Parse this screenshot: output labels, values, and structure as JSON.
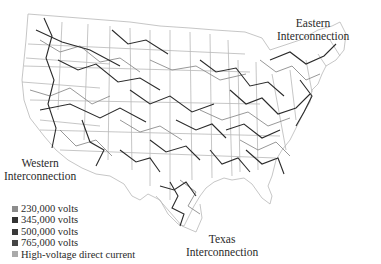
{
  "map": {
    "subject": "U.S. electric power transmission grid",
    "regions": [
      {
        "id": "eastern",
        "label_line1": "Eastern",
        "label_line2": "Interconnection"
      },
      {
        "id": "western",
        "label_line1": "Western",
        "label_line2": "Interconnection"
      },
      {
        "id": "texas",
        "label_line1": "Texas",
        "label_line2": "Interconnection"
      }
    ]
  },
  "legend": {
    "items": [
      {
        "label": "230,000 volts",
        "color": "#8c8c8c"
      },
      {
        "label": "345,000 volts",
        "color": "#333333"
      },
      {
        "label": "500,000 volts",
        "color": "#3a3a3a"
      },
      {
        "label": "765,000 volts",
        "color": "#454545"
      },
      {
        "label": "High-voltage direct current",
        "color": "#aaaaaa"
      }
    ]
  },
  "colors": {
    "state_border": "#b5b5b5",
    "line_dark": "#2b2b2b",
    "line_light": "#8c8c8c"
  }
}
